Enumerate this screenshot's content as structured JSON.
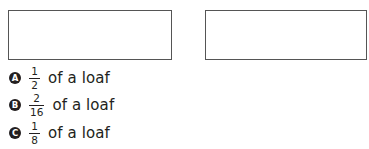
{
  "answer_boxes": [
    {
      "id": "box-1",
      "content": ""
    },
    {
      "id": "box-2",
      "content": ""
    }
  ],
  "options": [
    {
      "letter": "A",
      "numerator": "1",
      "denominator": "2",
      "text": "of a loaf"
    },
    {
      "letter": "B",
      "numerator": "2",
      "denominator": "16",
      "text": "of a loaf"
    },
    {
      "letter": "C",
      "numerator": "1",
      "denominator": "8",
      "text": "of a loaf"
    }
  ],
  "colors": {
    "text": "#231f20",
    "box_border": "#555555",
    "background": "#ffffff"
  }
}
